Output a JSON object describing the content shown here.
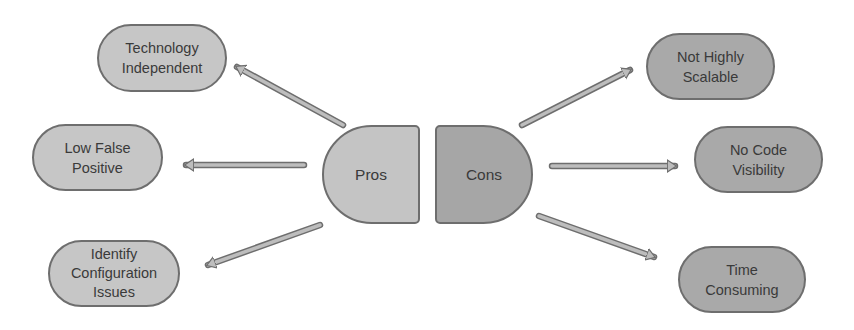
{
  "diagram": {
    "colors": {
      "pros_fill": "#c4c4c4",
      "cons_fill": "#a6a6a6",
      "border": "#6e6e6e",
      "arrow_fill": "#bdbdbd",
      "text": "#3a3a3a"
    },
    "pros": {
      "label": "Pros",
      "items": [
        {
          "label": "Technology\nIndependent"
        },
        {
          "label": "Low False\nPositive"
        },
        {
          "label": "Identify\nConfiguration\nIssues"
        }
      ]
    },
    "cons": {
      "label": "Cons",
      "items": [
        {
          "label": "Not Highly\nScalable"
        },
        {
          "label": "No Code\nVisibility"
        },
        {
          "label": "Time\nConsuming"
        }
      ]
    }
  }
}
